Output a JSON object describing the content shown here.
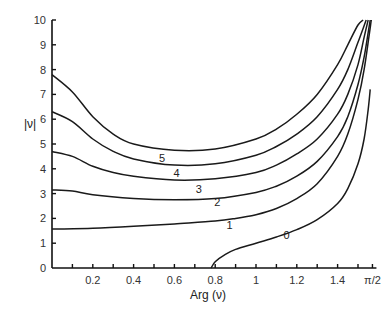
{
  "chart_data": {
    "type": "line",
    "title": "",
    "xlabel": "Arg (ν)",
    "ylabel": "|ν|",
    "xlim": [
      0,
      1.5708
    ],
    "ylim": [
      0,
      10
    ],
    "grid": false,
    "legend": "inline curve labels",
    "x_ticks": [
      {
        "value": 0.2,
        "label": "0.2"
      },
      {
        "value": 0.4,
        "label": "0.4"
      },
      {
        "value": 0.6,
        "label": "0.6"
      },
      {
        "value": 0.8,
        "label": "0.8"
      },
      {
        "value": 1.0,
        "label": "1"
      },
      {
        "value": 1.2,
        "label": "1.2"
      },
      {
        "value": 1.4,
        "label": "1.4"
      },
      {
        "value": 1.5708,
        "label": "π/2"
      }
    ],
    "x_minor_ticks": [
      0.1,
      0.3,
      0.5,
      0.7,
      0.9,
      1.1,
      1.3,
      1.5
    ],
    "y_ticks": [
      {
        "value": 0,
        "label": "0"
      },
      {
        "value": 1,
        "label": "1"
      },
      {
        "value": 2,
        "label": "2"
      },
      {
        "value": 3,
        "label": "3"
      },
      {
        "value": 4,
        "label": "4"
      },
      {
        "value": 5,
        "label": "5"
      },
      {
        "value": 6,
        "label": "6"
      },
      {
        "value": 7,
        "label": "7"
      },
      {
        "value": 8,
        "label": "8"
      },
      {
        "value": 9,
        "label": "9"
      },
      {
        "value": 10,
        "label": "10"
      }
    ],
    "series": [
      {
        "name": "0",
        "label_pos": [
          1.15,
          1.35
        ],
        "x": [
          0.78,
          0.8,
          0.85,
          0.9,
          1.0,
          1.1,
          1.2,
          1.3,
          1.4,
          1.45,
          1.5,
          1.53,
          1.55,
          1.56
        ],
        "y": [
          0.0,
          0.25,
          0.55,
          0.75,
          1.0,
          1.25,
          1.55,
          1.95,
          2.6,
          3.2,
          4.2,
          5.2,
          6.4,
          7.2
        ]
      },
      {
        "name": "1",
        "label_pos": [
          0.87,
          1.72
        ],
        "x": [
          0.0,
          0.2,
          0.4,
          0.6,
          0.8,
          0.9,
          1.0,
          1.1,
          1.2,
          1.3,
          1.4,
          1.45,
          1.5,
          1.53,
          1.555,
          1.565
        ],
        "y": [
          1.57,
          1.6,
          1.68,
          1.78,
          1.9,
          2.0,
          2.15,
          2.4,
          2.8,
          3.4,
          4.5,
          5.4,
          6.8,
          8.0,
          9.4,
          10.0
        ]
      },
      {
        "name": "2",
        "label_pos": [
          0.81,
          2.65
        ],
        "x": [
          0.0,
          0.1,
          0.2,
          0.4,
          0.6,
          0.8,
          1.0,
          1.1,
          1.2,
          1.3,
          1.4,
          1.45,
          1.5,
          1.53,
          1.55,
          1.56
        ],
        "y": [
          3.15,
          3.1,
          2.95,
          2.8,
          2.75,
          2.8,
          3.05,
          3.3,
          3.7,
          4.3,
          5.3,
          6.1,
          7.4,
          8.5,
          9.5,
          10.0
        ]
      },
      {
        "name": "3",
        "label_pos": [
          0.72,
          3.2
        ],
        "x": [
          0.0,
          0.1,
          0.2,
          0.3,
          0.4,
          0.6,
          0.8,
          1.0,
          1.1,
          1.2,
          1.3,
          1.4,
          1.45,
          1.5,
          1.53,
          1.55
        ],
        "y": [
          4.7,
          4.5,
          4.1,
          3.85,
          3.7,
          3.55,
          3.6,
          3.85,
          4.15,
          4.6,
          5.2,
          6.2,
          7.0,
          8.2,
          9.3,
          10.0
        ]
      },
      {
        "name": "4",
        "label_pos": [
          0.61,
          3.85
        ],
        "x": [
          0.0,
          0.1,
          0.2,
          0.3,
          0.4,
          0.6,
          0.8,
          1.0,
          1.1,
          1.2,
          1.3,
          1.4,
          1.45,
          1.5,
          1.54
        ],
        "y": [
          6.3,
          5.9,
          5.2,
          4.7,
          4.4,
          4.15,
          4.2,
          4.55,
          4.9,
          5.4,
          6.1,
          7.2,
          8.0,
          9.1,
          10.0
        ]
      },
      {
        "name": "5",
        "label_pos": [
          0.54,
          4.45
        ],
        "x": [
          0.0,
          0.1,
          0.2,
          0.3,
          0.4,
          0.6,
          0.8,
          1.0,
          1.1,
          1.2,
          1.3,
          1.4,
          1.45,
          1.5,
          1.525
        ],
        "y": [
          7.8,
          7.1,
          6.1,
          5.4,
          5.0,
          4.75,
          4.8,
          5.2,
          5.6,
          6.2,
          7.0,
          8.2,
          9.0,
          9.8,
          10.0
        ]
      }
    ]
  }
}
